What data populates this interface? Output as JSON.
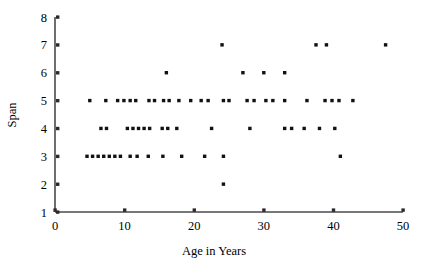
{
  "chart_data": {
    "type": "scatter",
    "title": "",
    "xlabel": "Age in Years",
    "ylabel": "Span",
    "xlim": [
      0,
      50
    ],
    "ylim": [
      1,
      8
    ],
    "xticks": [
      0,
      10,
      20,
      30,
      40,
      50
    ],
    "yticks": [
      1,
      2,
      3,
      4,
      5,
      6,
      7,
      8
    ],
    "xtick_labels": [
      "0",
      "10",
      "20",
      "30",
      "40",
      "50"
    ],
    "ytick_labels": [
      "1",
      "2",
      "3",
      "4",
      "5",
      "6",
      "7",
      "8"
    ],
    "grid": false,
    "legend": null,
    "marker": "square",
    "marker_color": "#111111",
    "axis_color": "#4a4a4a",
    "points": [
      {
        "x": 24.0,
        "y": 7
      },
      {
        "x": 37.5,
        "y": 7
      },
      {
        "x": 39.0,
        "y": 7
      },
      {
        "x": 47.5,
        "y": 7
      },
      {
        "x": 16.0,
        "y": 6
      },
      {
        "x": 27.0,
        "y": 6
      },
      {
        "x": 30.0,
        "y": 6
      },
      {
        "x": 33.0,
        "y": 6
      },
      {
        "x": 5.0,
        "y": 5
      },
      {
        "x": 7.3,
        "y": 5
      },
      {
        "x": 9.0,
        "y": 5
      },
      {
        "x": 9.9,
        "y": 5
      },
      {
        "x": 10.8,
        "y": 5
      },
      {
        "x": 11.6,
        "y": 5
      },
      {
        "x": 13.5,
        "y": 5
      },
      {
        "x": 14.3,
        "y": 5
      },
      {
        "x": 15.6,
        "y": 5
      },
      {
        "x": 16.4,
        "y": 5
      },
      {
        "x": 17.8,
        "y": 5
      },
      {
        "x": 19.5,
        "y": 5
      },
      {
        "x": 21.0,
        "y": 5
      },
      {
        "x": 22.0,
        "y": 5
      },
      {
        "x": 24.2,
        "y": 5
      },
      {
        "x": 25.0,
        "y": 5
      },
      {
        "x": 27.6,
        "y": 5
      },
      {
        "x": 28.6,
        "y": 5
      },
      {
        "x": 30.3,
        "y": 5
      },
      {
        "x": 31.3,
        "y": 5
      },
      {
        "x": 33.0,
        "y": 5
      },
      {
        "x": 36.2,
        "y": 5
      },
      {
        "x": 38.8,
        "y": 5
      },
      {
        "x": 39.8,
        "y": 5
      },
      {
        "x": 40.8,
        "y": 5
      },
      {
        "x": 42.8,
        "y": 5
      },
      {
        "x": 6.6,
        "y": 4
      },
      {
        "x": 7.4,
        "y": 4
      },
      {
        "x": 10.4,
        "y": 4
      },
      {
        "x": 11.2,
        "y": 4
      },
      {
        "x": 12.0,
        "y": 4
      },
      {
        "x": 12.8,
        "y": 4
      },
      {
        "x": 13.6,
        "y": 4
      },
      {
        "x": 15.4,
        "y": 4
      },
      {
        "x": 16.2,
        "y": 4
      },
      {
        "x": 17.5,
        "y": 4
      },
      {
        "x": 22.5,
        "y": 4
      },
      {
        "x": 28.0,
        "y": 4
      },
      {
        "x": 33.0,
        "y": 4
      },
      {
        "x": 34.0,
        "y": 4
      },
      {
        "x": 35.8,
        "y": 4
      },
      {
        "x": 38.0,
        "y": 4
      },
      {
        "x": 40.2,
        "y": 4
      },
      {
        "x": 4.6,
        "y": 3
      },
      {
        "x": 5.4,
        "y": 3
      },
      {
        "x": 6.2,
        "y": 3
      },
      {
        "x": 7.0,
        "y": 3
      },
      {
        "x": 7.8,
        "y": 3
      },
      {
        "x": 8.6,
        "y": 3
      },
      {
        "x": 9.4,
        "y": 3
      },
      {
        "x": 10.8,
        "y": 3
      },
      {
        "x": 11.8,
        "y": 3
      },
      {
        "x": 13.4,
        "y": 3
      },
      {
        "x": 15.5,
        "y": 3
      },
      {
        "x": 18.2,
        "y": 3
      },
      {
        "x": 21.5,
        "y": 3
      },
      {
        "x": 24.2,
        "y": 3
      },
      {
        "x": 41.0,
        "y": 3
      },
      {
        "x": 24.2,
        "y": 2
      }
    ]
  }
}
